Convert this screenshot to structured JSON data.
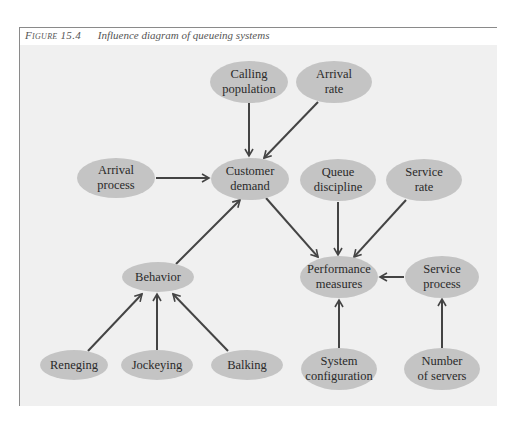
{
  "figure": {
    "number": "Figure 15.4",
    "title": "Influence diagram of queueing systems"
  },
  "colors": {
    "panel_bg": "#f0f0f0",
    "node_fill": "#c4c4c4",
    "arrow": "#444444",
    "frame": "#8a8a8a"
  },
  "nodes": {
    "calling_population": {
      "line1": "Calling",
      "line2": "population",
      "cx": 249,
      "cy": 82,
      "rx": 39,
      "ry": 21
    },
    "arrival_rate": {
      "line1": "Arrival",
      "line2": "rate",
      "cx": 334,
      "cy": 82,
      "rx": 38,
      "ry": 21
    },
    "arrival_process": {
      "line1": "Arrival",
      "line2": "process",
      "cx": 116,
      "cy": 178,
      "rx": 39,
      "ry": 20
    },
    "customer_demand": {
      "line1": "Customer",
      "line2": "demand",
      "cx": 250,
      "cy": 179,
      "rx": 39,
      "ry": 21
    },
    "queue_discipline": {
      "line1": "Queue",
      "line2": "discipline",
      "cx": 338,
      "cy": 180,
      "rx": 38,
      "ry": 21
    },
    "service_rate": {
      "line1": "Service",
      "line2": "rate",
      "cx": 424,
      "cy": 180,
      "rx": 38,
      "ry": 21
    },
    "behavior": {
      "line1": "Behavior",
      "cx": 158,
      "cy": 277,
      "rx": 36,
      "ry": 15
    },
    "performance_measures": {
      "line1": "Performance",
      "line2": "measures",
      "cx": 339,
      "cy": 277,
      "rx": 39,
      "ry": 21
    },
    "service_process": {
      "line1": "Service",
      "line2": "process",
      "cx": 442,
      "cy": 277,
      "rx": 37,
      "ry": 21
    },
    "reneging": {
      "line1": "Reneging",
      "cx": 74,
      "cy": 365,
      "rx": 34,
      "ry": 15
    },
    "jockeying": {
      "line1": "Jockeying",
      "cx": 157,
      "cy": 365,
      "rx": 36,
      "ry": 15
    },
    "balking": {
      "line1": "Balking",
      "cx": 247,
      "cy": 365,
      "rx": 36,
      "ry": 15
    },
    "system_configuration": {
      "line1": "System",
      "line2": "configuration",
      "cx": 339,
      "cy": 369,
      "rx": 38,
      "ry": 21
    },
    "number_of_servers": {
      "line1": "Number",
      "line2": "of servers",
      "cx": 442,
      "cy": 369,
      "rx": 38,
      "ry": 21
    }
  },
  "edges": [
    {
      "from": "Calling population",
      "to": "Customer demand"
    },
    {
      "from": "Arrival rate",
      "to": "Customer demand"
    },
    {
      "from": "Arrival process",
      "to": "Customer demand"
    },
    {
      "from": "Behavior",
      "to": "Customer demand"
    },
    {
      "from": "Customer demand",
      "to": "Performance measures"
    },
    {
      "from": "Queue discipline",
      "to": "Performance measures"
    },
    {
      "from": "Service rate",
      "to": "Performance measures"
    },
    {
      "from": "Service process",
      "to": "Performance measures"
    },
    {
      "from": "System configuration",
      "to": "Performance measures"
    },
    {
      "from": "Number of servers",
      "to": "Service process"
    },
    {
      "from": "Reneging",
      "to": "Behavior"
    },
    {
      "from": "Jockeying",
      "to": "Behavior"
    },
    {
      "from": "Balking",
      "to": "Behavior"
    }
  ]
}
